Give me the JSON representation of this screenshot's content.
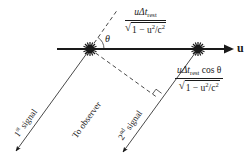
{
  "diagram": {
    "colors": {
      "ink": "#1a1a1a",
      "background": "#ffffff"
    },
    "velocity_label": "u",
    "angle_label": "θ",
    "top_expression": {
      "numerator_prefix": "uΔt",
      "numerator_sub": "rest",
      "numerator_suffix": "",
      "denominator_one": "1 − u",
      "denominator_sup": "2",
      "denominator_mid": "/c",
      "denominator_sup2": "2"
    },
    "side_expression": {
      "numerator_prefix": "uΔt",
      "numerator_sub": "rest",
      "numerator_suffix": " cos θ",
      "denominator_one": "1 − u",
      "denominator_sup": "2",
      "denominator_mid": "/c",
      "denominator_sup2": "2"
    },
    "signal_labels": {
      "first_number": "1",
      "first_sup": "st",
      "first_word": " signal",
      "second_number": "2",
      "second_sup": "nd",
      "second_word": " signal",
      "observer": "To observer"
    },
    "geometry": {
      "event1": {
        "x": 90,
        "y": 49
      },
      "event2": {
        "x": 198,
        "y": 49
      },
      "axis_start_x": 57,
      "axis_end_x": 233,
      "signal1_end": {
        "x": 15,
        "y": 152
      },
      "signal2_end": {
        "x": 122,
        "y": 153
      },
      "dashed_up_end": {
        "x": 118,
        "y": 10
      },
      "dashed_foot": {
        "x": 158,
        "y": 98
      }
    }
  }
}
